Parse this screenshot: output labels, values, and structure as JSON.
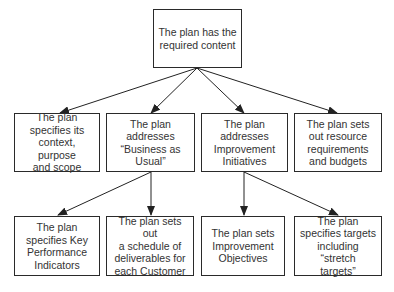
{
  "diagram": {
    "type": "tree",
    "colors": {
      "border": "#2a2a2a",
      "text": "#333333",
      "arrow": "#222222",
      "background": "#ffffff"
    },
    "root": {
      "id": "root",
      "label": "The plan has the\nrequired content"
    },
    "level1": [
      {
        "id": "context",
        "label": "The plan\nspecifies its\ncontext, purpose\nand scope"
      },
      {
        "id": "bau",
        "label": "The plan\naddresses\n“Business as\nUsual”"
      },
      {
        "id": "improvement",
        "label": "The plan\naddresses\nImprovement\nInitiatives"
      },
      {
        "id": "resources",
        "label": "The plan sets\nout resource\nrequirements\nand budgets"
      }
    ],
    "level2": [
      {
        "id": "kpi",
        "parent": "bau",
        "label": "The plan\nspecifies Key\nPerformance\nIndicators"
      },
      {
        "id": "schedule",
        "parent": "bau",
        "label": "The plan sets out\na schedule of\ndeliverables for\neach Customer"
      },
      {
        "id": "objectives",
        "parent": "improvement",
        "label": "The plan sets\nImprovement\nObjectives"
      },
      {
        "id": "targets",
        "parent": "improvement",
        "label": "The plan\nspecifies targets\nincluding “stretch\ntargets”"
      }
    ],
    "edges": [
      {
        "from": "root",
        "to": "context"
      },
      {
        "from": "root",
        "to": "bau"
      },
      {
        "from": "root",
        "to": "improvement"
      },
      {
        "from": "root",
        "to": "resources"
      },
      {
        "from": "bau",
        "to": "kpi"
      },
      {
        "from": "bau",
        "to": "schedule"
      },
      {
        "from": "improvement",
        "to": "objectives"
      },
      {
        "from": "improvement",
        "to": "targets"
      }
    ]
  }
}
